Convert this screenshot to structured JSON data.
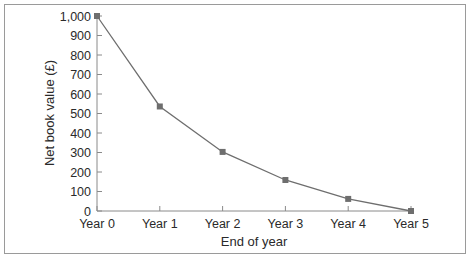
{
  "chart_data": {
    "type": "line",
    "title": "",
    "xlabel": "End of year",
    "ylabel": "Net book value (£)",
    "categories": [
      "Year 0",
      "Year 1",
      "Year 2",
      "Year 3",
      "Year 4",
      "Year 5"
    ],
    "series": [
      {
        "name": "Net book value",
        "values": [
          1000,
          536,
          303,
          159,
          62,
          0
        ]
      }
    ],
    "ylim": [
      0,
      1000
    ],
    "yticks": [
      0,
      100,
      200,
      300,
      400,
      500,
      600,
      700,
      800,
      900,
      1000
    ],
    "ytick_labels": [
      "0",
      "100",
      "200",
      "300",
      "400",
      "500",
      "600",
      "700",
      "800",
      "900",
      "1,000"
    ],
    "grid": false,
    "legend": "none",
    "colors": {
      "line": "#6e6e6e",
      "marker": "#6e6e6e",
      "axis": "#8a8a8a",
      "frame": "#9a9a9a"
    }
  }
}
